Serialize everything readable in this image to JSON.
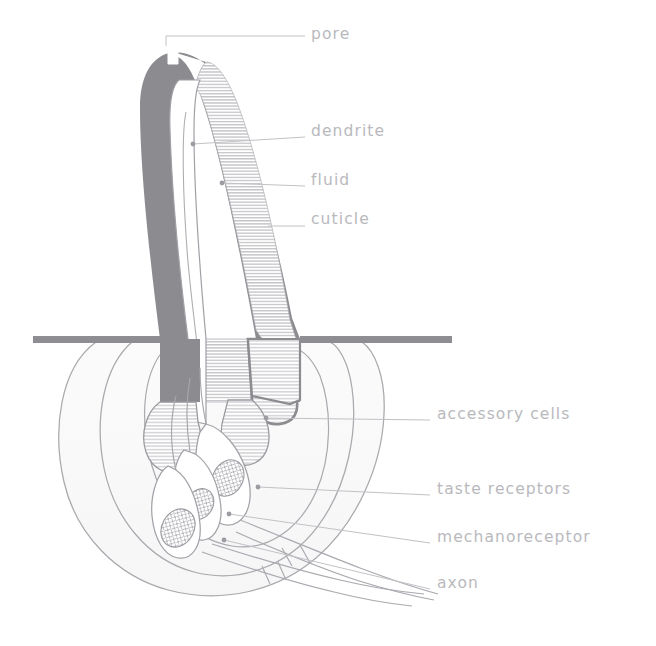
{
  "figure": {
    "background_color": "#ffffff",
    "ink_color": "#8a8a90",
    "cuticle_wall_color": "#8b8b90",
    "hatch_color": "#b0b0b5",
    "epidermis_color": "#8d8d92",
    "label_color": "#b9b9bd",
    "leader_color": "#c2c2c6"
  },
  "labels": [
    {
      "id": "pore",
      "text": "pore",
      "x": 311,
      "y": 34,
      "dot": false,
      "leader": [
        [
          166,
          46
        ],
        [
          166,
          36
        ],
        [
          305,
          36
        ]
      ]
    },
    {
      "id": "dendrite",
      "text": "dendrite",
      "x": 311,
      "y": 131,
      "dot": true,
      "leader": [
        [
          193,
          144
        ],
        [
          305,
          137
        ]
      ]
    },
    {
      "id": "fluid",
      "text": "fluid",
      "x": 311,
      "y": 180,
      "dot": true,
      "leader": [
        [
          222,
          183
        ],
        [
          305,
          186
        ]
      ]
    },
    {
      "id": "cuticle",
      "text": "cuticle",
      "x": 311,
      "y": 219,
      "dot": false,
      "leader": [
        [
          268,
          226
        ],
        [
          305,
          226
        ]
      ]
    },
    {
      "id": "accessory-cells",
      "text": "accessory cells",
      "x": 437,
      "y": 414,
      "dot": true,
      "leader": [
        [
          266,
          418
        ],
        [
          430,
          420
        ]
      ]
    },
    {
      "id": "taste-receptors",
      "text": "taste receptors",
      "x": 437,
      "y": 489,
      "dot": true,
      "leader": [
        [
          258,
          487
        ],
        [
          430,
          495
        ]
      ]
    },
    {
      "id": "mechanoreceptor",
      "text": "mechanoreceptor",
      "x": 437,
      "y": 537,
      "dot": true,
      "leader": [
        [
          229,
          514
        ],
        [
          430,
          543
        ]
      ]
    },
    {
      "id": "axon",
      "text": "axon",
      "x": 437,
      "y": 583,
      "dot": true,
      "leader": [
        [
          224,
          540
        ],
        [
          430,
          589
        ]
      ]
    }
  ],
  "structures": {
    "epidermis_line": {
      "y": 339,
      "x_left": 33,
      "x_right": 452,
      "thickness": 7
    },
    "sensillum": {
      "tip_x": 173,
      "tip_y": 52,
      "base_y": 400,
      "curve": "right-leaning tapered spine"
    },
    "nuclei_count": 3,
    "accessory_envelopes": 3,
    "axon_bundles": 4
  }
}
